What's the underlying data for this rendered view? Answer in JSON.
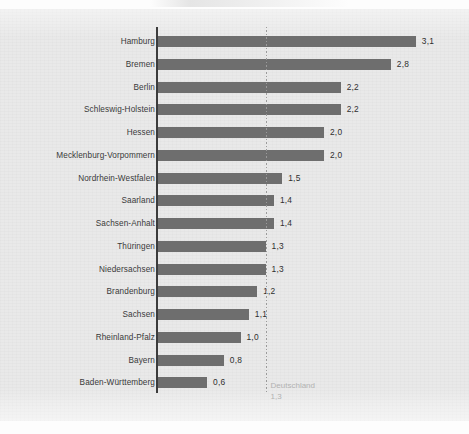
{
  "chart_data": {
    "type": "bar",
    "orientation": "horizontal",
    "title": "",
    "xlabel": "",
    "ylabel": "",
    "xlim": [
      0,
      3.4
    ],
    "grid": false,
    "legend": "none",
    "decimal_separator": ",",
    "categories": [
      "Hamburg",
      "Bremen",
      "Berlin",
      "Schleswig-Holstein",
      "Hessen",
      "Mecklenburg-Vorpommern",
      "Nordrhein-Westfalen",
      "Saarland",
      "Sachsen-Anhalt",
      "Thüringen",
      "Niedersachsen",
      "Brandenburg",
      "Sachsen",
      "Rheinland-Pfalz",
      "Bayern",
      "Baden-Württemberg"
    ],
    "values": [
      3.1,
      2.8,
      2.2,
      2.2,
      2.0,
      2.0,
      1.5,
      1.4,
      1.4,
      1.3,
      1.3,
      1.2,
      1.1,
      1.0,
      0.8,
      0.6
    ],
    "value_labels": [
      "3,1",
      "2,8",
      "2,2",
      "2,2",
      "2,0",
      "2,0",
      "1,5",
      "1,4",
      "1,4",
      "1,3",
      "1,3",
      "1,2",
      "1,1",
      "1,0",
      "0,8",
      "0,6"
    ],
    "reference_line": {
      "label": "Deutschland",
      "value": 1.3,
      "value_label": "1,3"
    },
    "colors": {
      "bar": "#6e6e6e",
      "axis": "#3c3c3c",
      "panel_background": "#e9e9e9",
      "page_background": "#fdfdfd",
      "category_text": "#3a3a3a",
      "value_text": "#2f2f2f",
      "reference_line": "#9a9a9a",
      "reference_text": "#b2b2b2"
    }
  }
}
